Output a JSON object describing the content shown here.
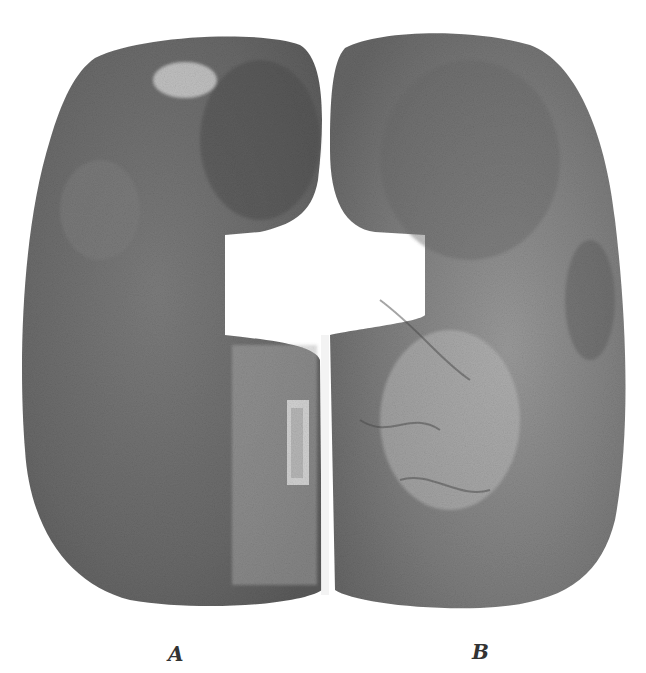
{
  "figure": {
    "panels": [
      {
        "id": "A",
        "label": "A",
        "tone": "#6f6f6f"
      },
      {
        "id": "B",
        "label": "B",
        "tone": "#7a7a7a"
      }
    ],
    "colors": {
      "background": "#ffffff",
      "tissue_dark": "#555555",
      "tissue_light": "#9a9a9a"
    }
  }
}
